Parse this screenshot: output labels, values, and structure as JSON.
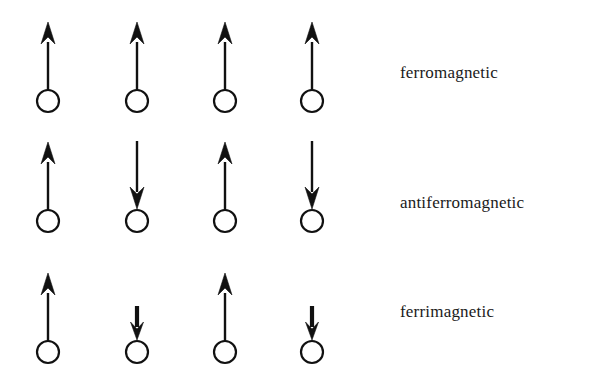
{
  "figure": {
    "background_color": "#ffffff",
    "ink_color": "#111111",
    "width": 592,
    "height": 384
  },
  "rows": [
    {
      "id": "ferromagnetic",
      "label": "ferromagnetic",
      "label_x": 400,
      "label_y": 64,
      "circle_cy": 101,
      "spins": [
        {
          "site": 1,
          "cx": 48,
          "direction": "up",
          "length": "long"
        },
        {
          "site": 2,
          "cx": 137,
          "direction": "up",
          "length": "long"
        },
        {
          "site": 3,
          "cx": 225,
          "direction": "up",
          "length": "long"
        },
        {
          "site": 4,
          "cx": 312,
          "direction": "up",
          "length": "long"
        }
      ]
    },
    {
      "id": "antiferromagnetic",
      "label": "antiferromagnetic",
      "label_x": 400,
      "label_y": 194,
      "circle_cy": 221,
      "spins": [
        {
          "site": 1,
          "cx": 48,
          "direction": "up",
          "length": "long"
        },
        {
          "site": 2,
          "cx": 137,
          "direction": "down",
          "length": "long"
        },
        {
          "site": 3,
          "cx": 225,
          "direction": "up",
          "length": "long"
        },
        {
          "site": 4,
          "cx": 312,
          "direction": "down",
          "length": "long"
        }
      ]
    },
    {
      "id": "ferrimagnetic",
      "label": "ferrimagnetic",
      "label_x": 400,
      "label_y": 303,
      "circle_cy": 352,
      "spins": [
        {
          "site": 1,
          "cx": 48,
          "direction": "up",
          "length": "long"
        },
        {
          "site": 2,
          "cx": 137,
          "direction": "down",
          "length": "short"
        },
        {
          "site": 3,
          "cx": 225,
          "direction": "up",
          "length": "long"
        },
        {
          "site": 4,
          "cx": 312,
          "direction": "down",
          "length": "short"
        }
      ]
    }
  ],
  "geometry": {
    "circle_radius": 11,
    "circle_stroke_width": 2.2,
    "shaft_width_long": 2.4,
    "shaft_width_short": 4.2,
    "arrow_long_length": 68,
    "arrow_short_length": 34,
    "arrowhead_long_height": 20,
    "arrowhead_long_half_width": 7,
    "arrowhead_short_height": 16,
    "arrowhead_short_half_width": 6.5
  }
}
